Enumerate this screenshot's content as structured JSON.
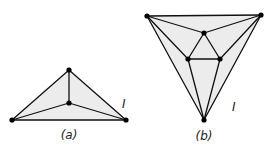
{
  "figures": [
    {
      "id": "a",
      "caption": "(a)",
      "face_label": "I",
      "face_label_pos": [
        124,
        107
      ],
      "caption_pos": [
        69,
        138
      ],
      "vertices": [
        [
          12,
          120
        ],
        [
          126,
          120
        ],
        [
          69,
          70
        ],
        [
          69,
          103
        ]
      ],
      "edges": [
        [
          0,
          1
        ],
        [
          0,
          2
        ],
        [
          1,
          2
        ],
        [
          2,
          3
        ],
        [
          0,
          3
        ],
        [
          1,
          3
        ]
      ],
      "outer": [
        0,
        2,
        1
      ]
    },
    {
      "id": "b",
      "caption": "(b)",
      "face_label": "I",
      "face_label_pos": [
        233,
        110
      ],
      "caption_pos": [
        204,
        137
      ],
      "vertices": [
        [
          147,
          16
        ],
        [
          261,
          15
        ],
        [
          204,
          33
        ],
        [
          188,
          59
        ],
        [
          220,
          59
        ],
        [
          204,
          120
        ]
      ],
      "edges": [
        [
          0,
          1
        ],
        [
          0,
          5
        ],
        [
          1,
          5
        ],
        [
          0,
          2
        ],
        [
          1,
          2
        ],
        [
          2,
          3
        ],
        [
          2,
          4
        ],
        [
          3,
          4
        ],
        [
          0,
          3
        ],
        [
          1,
          4
        ],
        [
          3,
          5
        ],
        [
          4,
          5
        ]
      ],
      "outer": [
        0,
        1,
        5
      ]
    }
  ],
  "colors": {
    "fill": "#ececec",
    "edge": "#111111",
    "vertex": "#000000"
  }
}
